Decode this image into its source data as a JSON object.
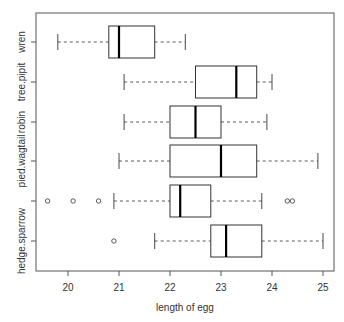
{
  "chart_data": {
    "type": "boxplot",
    "orientation": "horizontal",
    "title": "",
    "xlabel": "length of egg",
    "ylabel": "",
    "xlim": [
      19.4,
      25.2
    ],
    "x_ticks": [
      20,
      21,
      22,
      23,
      24,
      25
    ],
    "x_tick_labels": [
      "20",
      "21",
      "22",
      "23",
      "24",
      "25"
    ],
    "grid": false,
    "legend": null,
    "categories": [
      "hedge.sparrow",
      "meadow.pipit",
      "pied.wagtail",
      "robin",
      "tree.pipit",
      "wren"
    ],
    "y_tick_labels_visible": [
      "hedge.sparrow",
      "",
      "pied.wagtail",
      "robin",
      "tree.pipit",
      "wren"
    ],
    "series": [
      {
        "name": "hedge.sparrow",
        "whisker_low": 21.7,
        "q1": 22.8,
        "median": 23.1,
        "q3": 23.8,
        "whisker_high": 25.0,
        "outliers": [
          20.9
        ]
      },
      {
        "name": "meadow.pipit",
        "whisker_low": 20.9,
        "q1": 22.0,
        "median": 22.2,
        "q3": 22.8,
        "whisker_high": 23.8,
        "outliers": [
          19.6,
          20.1,
          20.6,
          24.3,
          24.4
        ]
      },
      {
        "name": "pied.wagtail",
        "whisker_low": 21.0,
        "q1": 22.0,
        "median": 23.0,
        "q3": 23.7,
        "whisker_high": 24.9,
        "outliers": []
      },
      {
        "name": "robin",
        "whisker_low": 21.1,
        "q1": 22.0,
        "median": 22.5,
        "q3": 23.0,
        "whisker_high": 23.9,
        "outliers": []
      },
      {
        "name": "tree.pipit",
        "whisker_low": 21.1,
        "q1": 22.5,
        "median": 23.3,
        "q3": 23.7,
        "whisker_high": 24.0,
        "outliers": []
      },
      {
        "name": "wren",
        "whisker_low": 19.8,
        "q1": 20.8,
        "median": 21.0,
        "q3": 21.7,
        "whisker_high": 22.3,
        "outliers": []
      }
    ],
    "colors": {
      "box_stroke": "#333333",
      "median": "#000000",
      "axis": "#555555",
      "text": "#333333",
      "background": "#ffffff"
    }
  }
}
